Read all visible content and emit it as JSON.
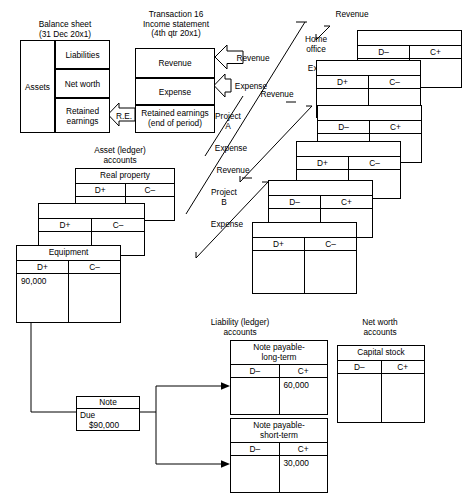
{
  "balance_sheet": {
    "heading": "Balance sheet\n(31 Dec 20x1)",
    "assets": "Assets",
    "rows": [
      "Liabilities",
      "Net worth",
      "Retained\nearnings"
    ]
  },
  "income_statement": {
    "heading": "Transaction 16\nIncome statement\n(4th qtr 20x1)",
    "rows": [
      "Revenue",
      "Expense",
      "Retained earnings\n(end of period)"
    ]
  },
  "closing_arrows": {
    "re": "R.E.",
    "revenue": "Revenue",
    "expense": "Expense"
  },
  "segments": [
    {
      "name": "Home office",
      "revenue_label": "Revenue",
      "expense_label": "Expense"
    },
    {
      "name": "Project\nA",
      "revenue_label": "Revenue",
      "expense_label": "Expense"
    },
    {
      "name": "Project\nB",
      "revenue_label": "Revenue",
      "expense_label": "Expense"
    }
  ],
  "segment_cards": [
    {
      "debit": "D–",
      "credit": "C+"
    },
    {
      "debit": "D+",
      "credit": "C–"
    },
    {
      "debit": "D–",
      "credit": "C+"
    },
    {
      "debit": "D+",
      "credit": "C–"
    },
    {
      "debit": "D–",
      "credit": "C+"
    },
    {
      "debit": "D+",
      "credit": "C–"
    }
  ],
  "asset_accounts": {
    "heading": "Asset (ledger)\naccounts",
    "cards": [
      {
        "title": "Real property",
        "debit": "D+",
        "credit": "C–",
        "debit_value": "",
        "credit_value": ""
      },
      {
        "title": "",
        "debit": "D+",
        "credit": "C–",
        "debit_value": "",
        "credit_value": ""
      },
      {
        "title": "Equipment",
        "debit": "D+",
        "credit": "C–",
        "debit_value": "90,000",
        "credit_value": ""
      }
    ]
  },
  "liability_accounts": {
    "heading": "Liability (ledger)\naccounts",
    "cards": [
      {
        "title": "Note payable-\nlong-term",
        "debit": "D–",
        "credit": "C+",
        "debit_value": "",
        "credit_value": "60,000"
      },
      {
        "title": "Note payable-\nshort-term",
        "debit": "D–",
        "credit": "C+",
        "debit_value": "",
        "credit_value": "30,000"
      }
    ]
  },
  "net_worth_accounts": {
    "heading": "Net worth\naccounts",
    "cards": [
      {
        "title": "Capital stock",
        "debit": "D–",
        "credit": "C+",
        "debit_value": "",
        "credit_value": ""
      }
    ]
  },
  "note_box": {
    "title": "Note",
    "line1": "Due",
    "line2": "$90,000"
  }
}
